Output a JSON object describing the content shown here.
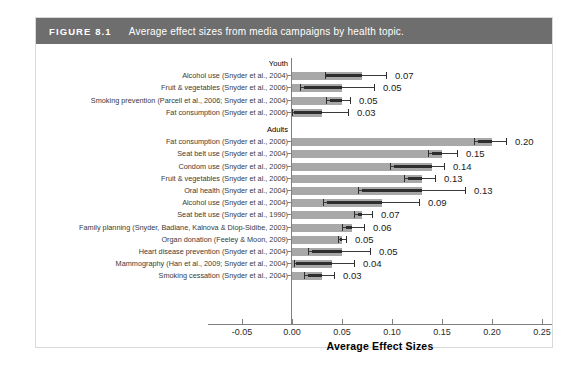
{
  "figure": {
    "number": "FIGURE 8.1",
    "caption": "Average effect sizes from media campaigns by health topic."
  },
  "chart_data": {
    "type": "bar",
    "orientation": "horizontal",
    "title": "Average effect sizes from media campaigns by health topic.",
    "xlabel": "Average Effect Sizes",
    "ylabel": "",
    "xlim": [
      -0.05,
      0.25
    ],
    "xticks": [
      -0.05,
      0.0,
      0.05,
      0.1,
      0.15,
      0.2,
      0.25
    ],
    "xticklabels": [
      "-0.05",
      "0.00",
      "0.05",
      "0.10",
      "0.15",
      "0.20",
      "0.25"
    ],
    "grid": false,
    "legend": "none",
    "bar_color": "#a8a8a8",
    "error_color": "#2e2e2e",
    "groups": [
      {
        "name": "Youth",
        "rows": [
          {
            "label": "Alcohol use (Snyder et al., 2004)",
            "value": 0.07,
            "value_label": "0.07",
            "ci_low": 0.033,
            "ci_high": 0.094,
            "box_low": 0.033,
            "box_high": 0.07
          },
          {
            "label": "Fruit & vegetables (Snyder et al., 2006)",
            "value": 0.05,
            "value_label": "0.05",
            "ci_low": 0.008,
            "ci_high": 0.082,
            "box_low": 0.012,
            "box_high": 0.05
          },
          {
            "label": "Smoking prevention (Parcell et al., 2006; Snyder et al., 2004)",
            "value": 0.05,
            "value_label": "0.05",
            "ci_low": 0.034,
            "ci_high": 0.058,
            "box_low": 0.038,
            "box_high": 0.05
          },
          {
            "label": "Fat consumption (Snyder et al., 2006)",
            "value": 0.03,
            "value_label": "0.03",
            "ci_low": 0.0,
            "ci_high": 0.056,
            "box_low": 0.002,
            "box_high": 0.03
          }
        ]
      },
      {
        "name": "Adults",
        "rows": [
          {
            "label": "Fat consumption (Snyder et al., 2006)",
            "value": 0.2,
            "value_label": "0.20",
            "ci_low": 0.182,
            "ci_high": 0.214,
            "box_low": 0.186,
            "box_high": 0.2
          },
          {
            "label": "Seat belt use (Snyder et al., 2004)",
            "value": 0.15,
            "value_label": "0.15",
            "ci_low": 0.136,
            "ci_high": 0.165,
            "box_low": 0.14,
            "box_high": 0.15
          },
          {
            "label": "Condom use (Snyder et al., 2009)",
            "value": 0.14,
            "value_label": "0.14",
            "ci_low": 0.098,
            "ci_high": 0.152,
            "box_low": 0.102,
            "box_high": 0.14
          },
          {
            "label": "Fruit & vegetables (Snyder et al., 2006)",
            "value": 0.13,
            "value_label": "0.13",
            "ci_low": 0.112,
            "ci_high": 0.143,
            "box_low": 0.116,
            "box_high": 0.13
          },
          {
            "label": "Oral health (Snyder et al., 2004)",
            "value": 0.13,
            "value_label": "0.13",
            "ci_low": 0.066,
            "ci_high": 0.173,
            "box_low": 0.07,
            "box_high": 0.13
          },
          {
            "label": "Alcohol use (Snyder et al., 2004)",
            "value": 0.09,
            "value_label": "0.09",
            "ci_low": 0.031,
            "ci_high": 0.127,
            "box_low": 0.035,
            "box_high": 0.09
          },
          {
            "label": "Seat belt use (Snyder et al., 1990)",
            "value": 0.07,
            "value_label": "0.07",
            "ci_low": 0.062,
            "ci_high": 0.08,
            "box_low": 0.066,
            "box_high": 0.07
          },
          {
            "label": "Family planning (Snyder, Badiane, Kalnova & Diop-Sidibe, 2003)",
            "value": 0.06,
            "value_label": "0.06",
            "ci_low": 0.05,
            "ci_high": 0.072,
            "box_low": 0.054,
            "box_high": 0.06
          },
          {
            "label": "Organ donation (Feeley & Moon, 2009)",
            "value": 0.05,
            "value_label": "0.05",
            "ci_low": 0.046,
            "ci_high": 0.054,
            "box_low": 0.048,
            "box_high": 0.05
          },
          {
            "label": "Heart disease prevention (Snyder et al., 2004)",
            "value": 0.05,
            "value_label": "0.05",
            "ci_low": 0.016,
            "ci_high": 0.078,
            "box_low": 0.02,
            "box_high": 0.05
          },
          {
            "label": "Mammography (Han et al., 2009; Snyder et al., 2004)",
            "value": 0.04,
            "value_label": "0.04",
            "ci_low": 0.002,
            "ci_high": 0.062,
            "box_low": 0.004,
            "box_high": 0.04
          },
          {
            "label": "Smoking cessation (Snyder et al., 2004)",
            "value": 0.03,
            "value_label": "0.03",
            "ci_low": 0.012,
            "ci_high": 0.042,
            "box_low": 0.016,
            "box_high": 0.03
          }
        ]
      }
    ]
  }
}
